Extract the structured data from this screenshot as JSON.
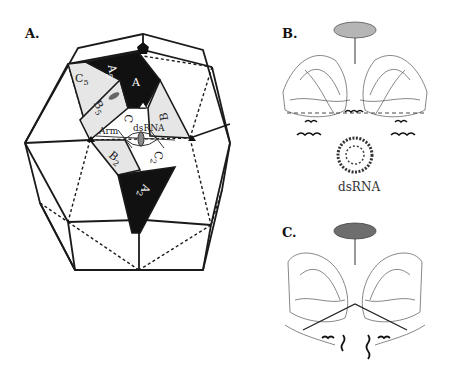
{
  "figure": {
    "panels": [
      {
        "id": "A",
        "label": "A.",
        "type": "icosahedron-schematic",
        "region_labels": {
          "A": "A",
          "A5": "A",
          "A5_sub": "5",
          "A2": "A",
          "A2_sub": "2",
          "B": "B",
          "B5": "B",
          "B5_sub": "5",
          "B2": "B",
          "B2_sub": "2",
          "C5": "C",
          "C5_sub": "5",
          "C": "C",
          "C2": "C",
          "C2_sub": "2",
          "arm": "Arm",
          "dsrna": "dsRNA"
        }
      },
      {
        "id": "B",
        "label": "B.",
        "type": "protein-dimer-structure",
        "axis_marker_color": "#b5b5b5",
        "caption": "dsRNA"
      },
      {
        "id": "C",
        "label": "C.",
        "type": "protein-dimer-structure",
        "axis_marker_color": "#6e6e6e"
      }
    ]
  },
  "colors": {
    "black_region": "#111111",
    "gray_region": "#e6e6e6",
    "line": "#1a1a1a",
    "b_oval": "#b5b5b5",
    "c_oval": "#6e6e6e"
  }
}
